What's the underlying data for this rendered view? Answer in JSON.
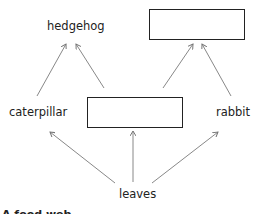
{
  "diagram": {
    "type": "food-web",
    "nodes": {
      "hedgehog": "hedgehog",
      "top_blank": "",
      "caterpillar": "caterpillar",
      "middle_blank": "",
      "rabbit": "rabbit",
      "leaves": "leaves"
    },
    "edges": [
      {
        "from": "caterpillar",
        "to": "hedgehog"
      },
      {
        "from": "middle_blank",
        "to": "hedgehog"
      },
      {
        "from": "middle_blank",
        "to": "top_blank"
      },
      {
        "from": "rabbit",
        "to": "top_blank"
      },
      {
        "from": "leaves",
        "to": "caterpillar"
      },
      {
        "from": "leaves",
        "to": "middle_blank"
      },
      {
        "from": "leaves",
        "to": "rabbit"
      }
    ],
    "clipped_caption": "A food web"
  }
}
